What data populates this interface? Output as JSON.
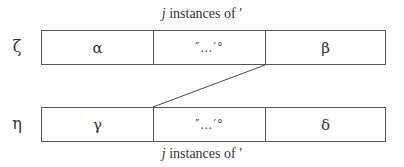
{
  "diagram": {
    "top_caption": {
      "var": "j",
      "text": " instances of ′"
    },
    "bottom_caption": {
      "var": "j",
      "text": " instances of ′"
    },
    "rows": [
      {
        "label": "ζ",
        "cells": [
          "α",
          "″…′°",
          "β"
        ]
      },
      {
        "label": "η",
        "cells": [
          "γ",
          "″…′°",
          "δ"
        ]
      }
    ],
    "connector": {
      "from": "top-row-cell-2-right-bottom",
      "to": "bottom-row-cell-2-left-top"
    }
  }
}
